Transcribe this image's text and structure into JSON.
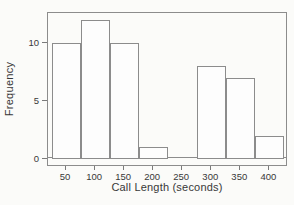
{
  "chart_data": {
    "type": "bar",
    "subtype": "histogram",
    "title": "",
    "xlabel": "Call Length (seconds)",
    "ylabel": "Frequency",
    "bin_centers": [
      50,
      100,
      150,
      200,
      250,
      300,
      350,
      400
    ],
    "bin_width": 50,
    "values": [
      10,
      12,
      10,
      1,
      0,
      8,
      7,
      2
    ],
    "x_tick_labels": [
      "50",
      "100",
      "150",
      "200",
      "250",
      "300",
      "350",
      "400"
    ],
    "y_ticks": [
      0,
      5,
      10
    ],
    "xlim": [
      19,
      432
    ],
    "ylim": [
      0,
      12.6
    ],
    "grid": false,
    "legend_position": "none",
    "colors": {
      "background": "#fbfbf9",
      "bar_fill": "#fdfdfd",
      "bar_border": "#8c8c8c",
      "frame": "#8c8c8c",
      "tick": "#7a7a7a",
      "text": "#383838"
    }
  }
}
